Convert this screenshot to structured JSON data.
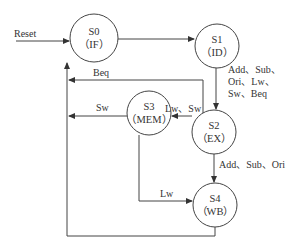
{
  "diagram": {
    "type": "state-machine",
    "states": [
      {
        "id": "S0",
        "name": "S0",
        "stage": "（IF）"
      },
      {
        "id": "S1",
        "name": "S1",
        "stage": "（ID）"
      },
      {
        "id": "S2",
        "name": "S2",
        "stage": "（EX）"
      },
      {
        "id": "S3",
        "name": "S3",
        "stage": "（MEM）"
      },
      {
        "id": "S4",
        "name": "S4",
        "stage": "（WB）"
      }
    ],
    "entry_label": "Reset",
    "transitions": [
      {
        "from": "S0",
        "to": "S1",
        "label": ""
      },
      {
        "from": "S1",
        "to": "S2",
        "label_lines": [
          "Add、Sub、",
          "Ori、Lw、",
          "Sw、Beq"
        ]
      },
      {
        "from": "S2",
        "to": "S0",
        "label": "Beq"
      },
      {
        "from": "S2",
        "to": "S3",
        "label": "Lw、Sw"
      },
      {
        "from": "S3",
        "to": "S0",
        "label": "Sw"
      },
      {
        "from": "S2",
        "to": "S4",
        "label": "Add、Sub、Ori"
      },
      {
        "from": "S3",
        "to": "S4",
        "label": "Lw"
      },
      {
        "from": "S4",
        "to": "S0",
        "label": ""
      }
    ]
  }
}
